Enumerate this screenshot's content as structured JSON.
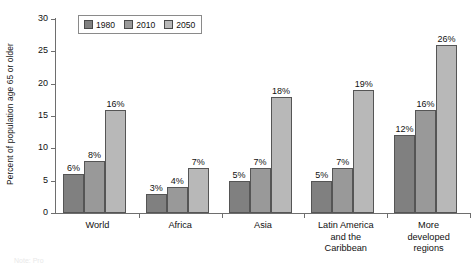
{
  "chart_data": {
    "type": "bar",
    "title": "",
    "subtitle": "",
    "xlabel": "",
    "ylabel": "Percent of population age 65 or older",
    "ylim": [
      0,
      30
    ],
    "yticks": [
      0,
      5,
      10,
      15,
      20,
      25,
      30
    ],
    "ytick_labels": [
      "0",
      "5",
      "10",
      "15",
      "20",
      "25",
      "30"
    ],
    "grid": false,
    "legend_position": "top-left-inside",
    "categories": [
      "World",
      "Africa",
      "Asia",
      "Latin America and the Caribbean",
      "More developed regions"
    ],
    "category_lines": [
      [
        "World"
      ],
      [
        "Africa"
      ],
      [
        "Asia"
      ],
      [
        "Latin America",
        "and the",
        "Caribbean"
      ],
      [
        "More",
        "developed",
        "regions"
      ]
    ],
    "series": [
      {
        "name": "1980",
        "color": "#808080",
        "values": [
          6,
          3,
          5,
          5,
          12
        ],
        "data_labels": [
          "6%",
          "3%",
          "5%",
          "5%",
          "12%"
        ]
      },
      {
        "name": "2010",
        "color": "#999999",
        "values": [
          8,
          4,
          7,
          7,
          16
        ],
        "data_labels": [
          "8%",
          "4%",
          "7%",
          "7%",
          "16%"
        ]
      },
      {
        "name": "2050",
        "color": "#b8b8b8",
        "values": [
          16,
          7,
          18,
          19,
          26
        ],
        "data_labels": [
          "16%",
          "7%",
          "18%",
          "19%",
          "26%"
        ]
      }
    ]
  },
  "legend": {
    "entries": [
      {
        "label": "1980"
      },
      {
        "label": "2010"
      },
      {
        "label": "2050"
      }
    ]
  },
  "footnote": {
    "text": "Note: Pro"
  }
}
